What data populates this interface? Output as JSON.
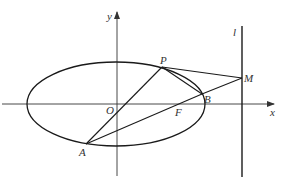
{
  "diagram": {
    "type": "ellipse-geometry",
    "colors": {
      "stroke": "#1a1a1a",
      "axis": "#333333",
      "label": "#333333"
    },
    "axes": {
      "x_label": "x",
      "y_label": "y",
      "origin_label": "O"
    },
    "directrix_label": "l",
    "points": {
      "P": "P",
      "M": "M",
      "B": "B",
      "F": "F",
      "A": "A"
    },
    "segments": [
      "PM",
      "MB",
      "PB",
      "AP",
      "AB"
    ]
  }
}
